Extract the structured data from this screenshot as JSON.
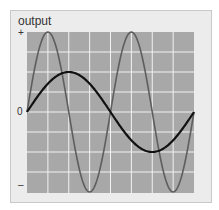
{
  "chart_data": {
    "type": "line",
    "title": "output",
    "xlabel": "",
    "ylabel": "output",
    "y_tick_labels": [
      "+",
      "0",
      "–"
    ],
    "ylim": [
      -1,
      1
    ],
    "xlim": [
      0,
      1
    ],
    "grid": true,
    "grid_color": "#f2f2f2",
    "plot_background": "#a8a8a8",
    "legend": null,
    "series": [
      {
        "name": "fast-wave",
        "color": "#5e5e5e",
        "description": "sine wave, amplitude 1, two full cycles",
        "amplitude": 1.0,
        "cycles": 2,
        "x": [
          0,
          0.125,
          0.25,
          0.375,
          0.5,
          0.625,
          0.75,
          0.875,
          1.0
        ],
        "values": [
          0,
          1,
          0,
          -1,
          0,
          1,
          0,
          -1,
          0
        ]
      },
      {
        "name": "slow-wave",
        "color": "#111111",
        "description": "sine wave, amplitude 0.5, one full cycle",
        "amplitude": 0.5,
        "cycles": 1,
        "x": [
          0,
          0.25,
          0.5,
          0.75,
          1.0
        ],
        "values": [
          0,
          0.5,
          0,
          -0.5,
          0
        ]
      }
    ]
  },
  "labels": {
    "title": "output",
    "plus": "+",
    "zero": "0",
    "minus": "–"
  }
}
